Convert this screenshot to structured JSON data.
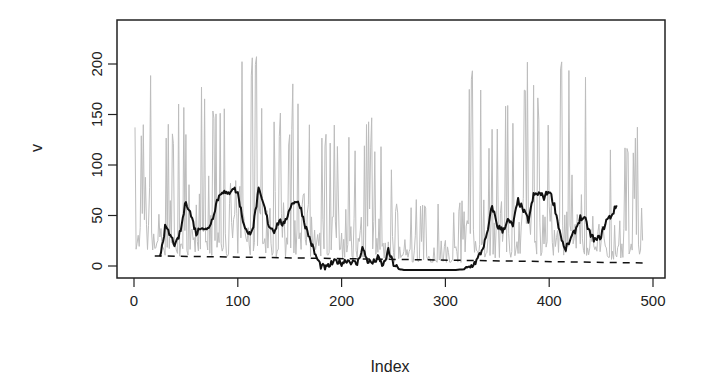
{
  "chart_data": {
    "type": "line",
    "title": "",
    "xlabel": "Index",
    "ylabel": "v",
    "xlim": [
      0,
      500
    ],
    "ylim": [
      -10,
      235
    ],
    "grid": false,
    "legend": null,
    "x_ticks": [
      0,
      100,
      200,
      300,
      400,
      500
    ],
    "y_ticks": [
      0,
      50,
      100,
      150,
      200
    ],
    "x_tick_labels": [
      "0",
      "100",
      "200",
      "300",
      "400",
      "500"
    ],
    "y_tick_labels": [
      "0",
      "50",
      "100",
      "150",
      "200"
    ],
    "series": [
      {
        "name": "v",
        "style": "solid",
        "color": "#bdbdbd",
        "width": 1,
        "description": "raw series, ~490 points, highly spiky; peaks up to ~230 near index 10-20, ~225 near 115, ~230 near 320-330, ~225 near 420; quiet region (mostly < 60) around index 250-320",
        "x_range": [
          1,
          490
        ],
        "envelope_peaks": [
          [
            8,
            135
          ],
          [
            12,
            232
          ],
          [
            17,
            230
          ],
          [
            22,
            175
          ],
          [
            35,
            160
          ],
          [
            55,
            170
          ],
          [
            72,
            210
          ],
          [
            80,
            185
          ],
          [
            100,
            200
          ],
          [
            115,
            225
          ],
          [
            135,
            175
          ],
          [
            150,
            155
          ],
          [
            155,
            210
          ],
          [
            165,
            185
          ],
          [
            175,
            155
          ],
          [
            185,
            150
          ],
          [
            195,
            155
          ],
          [
            205,
            130
          ],
          [
            225,
            150
          ],
          [
            240,
            140
          ],
          [
            255,
            60
          ],
          [
            270,
            135
          ],
          [
            285,
            110
          ],
          [
            300,
            175
          ],
          [
            318,
            230
          ],
          [
            325,
            230
          ],
          [
            340,
            145
          ],
          [
            360,
            165
          ],
          [
            382,
            210
          ],
          [
            398,
            170
          ],
          [
            420,
            228
          ],
          [
            435,
            210
          ],
          [
            448,
            178
          ],
          [
            460,
            130
          ],
          [
            470,
            140
          ]
        ]
      },
      {
        "name": "rolling mean",
        "style": "solid",
        "color": "#111111",
        "width": 2,
        "x": [
          25,
          30,
          35,
          40,
          45,
          50,
          55,
          60,
          65,
          70,
          75,
          80,
          85,
          90,
          95,
          100,
          105,
          110,
          115,
          120,
          125,
          130,
          135,
          140,
          145,
          150,
          155,
          160,
          165,
          170,
          175,
          180,
          185,
          190,
          195,
          200,
          205,
          210,
          215,
          220,
          225,
          230,
          235,
          240,
          245,
          250,
          255,
          260,
          270,
          280,
          290,
          300,
          310,
          320,
          325,
          330,
          335,
          340,
          345,
          350,
          355,
          360,
          365,
          370,
          375,
          380,
          385,
          390,
          395,
          400,
          405,
          410,
          415,
          420,
          425,
          430,
          435,
          440,
          445,
          450,
          455,
          460,
          465
        ],
        "y": [
          10,
          38,
          30,
          20,
          35,
          65,
          50,
          32,
          40,
          35,
          45,
          65,
          75,
          70,
          78,
          72,
          45,
          30,
          40,
          75,
          60,
          40,
          35,
          45,
          40,
          58,
          65,
          60,
          40,
          25,
          10,
          0,
          -2,
          2,
          5,
          3,
          6,
          4,
          2,
          18,
          5,
          3,
          8,
          0,
          15,
          2,
          -3,
          -4,
          -4,
          -4,
          -4,
          -4,
          -4,
          -3,
          0,
          5,
          15,
          30,
          60,
          40,
          35,
          45,
          40,
          65,
          55,
          45,
          70,
          72,
          68,
          75,
          60,
          35,
          15,
          25,
          35,
          48,
          45,
          30,
          25,
          30,
          45,
          50,
          60
        ]
      },
      {
        "name": "threshold",
        "style": "dashed",
        "color": "#111111",
        "width": 1.5,
        "x": [
          20,
          490
        ],
        "y": [
          10,
          3
        ]
      }
    ]
  }
}
